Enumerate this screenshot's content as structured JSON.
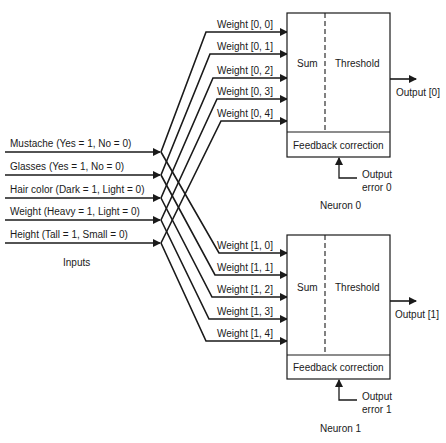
{
  "diagram": {
    "inputs_label": "Inputs",
    "inputs": [
      {
        "label": "Mustache (Yes = 1, No = 0)",
        "y": 152
      },
      {
        "label": "Glasses (Yes = 1, No = 0)",
        "y": 175
      },
      {
        "label": "Hair color (Dark = 1, Light = 0)",
        "y": 198
      },
      {
        "label": "Weight (Heavy = 1, Light = 0)",
        "y": 220
      },
      {
        "label": "Height (Tall = 1, Small = 0)",
        "y": 243
      }
    ],
    "neurons": [
      {
        "name": "Neuron 0",
        "sum_label": "Sum",
        "threshold_label": "Threshold",
        "feedback_label": "Feedback correction",
        "output_label": "Output [0]",
        "error_label_line1": "Output",
        "error_label_line2": "error 0",
        "weights": [
          {
            "label": "Weight [0, 0]",
            "y": 32,
            "corner_x": 206
          },
          {
            "label": "Weight [0, 1]",
            "y": 54,
            "corner_x": 210
          },
          {
            "label": "Weight [0, 2]",
            "y": 78,
            "corner_x": 213
          },
          {
            "label": "Weight [0, 3]",
            "y": 99,
            "corner_x": 217
          },
          {
            "label": "Weight [0, 4]",
            "y": 121,
            "corner_x": 221
          }
        ]
      },
      {
        "name": "Neuron 1",
        "sum_label": "Sum",
        "threshold_label": "Threshold",
        "feedback_label": "Feedback correction",
        "output_label": "Output [1]",
        "error_label_line1": "Output",
        "error_label_line2": "error 1",
        "weights": [
          {
            "label": "Weight [1, 0]",
            "y": 253,
            "corner_x": 219
          },
          {
            "label": "Weight [1, 1]",
            "y": 275,
            "corner_x": 215
          },
          {
            "label": "Weight [1, 2]",
            "y": 297,
            "corner_x": 212
          },
          {
            "label": "Weight [1, 3]",
            "y": 319,
            "corner_x": 209
          },
          {
            "label": "Weight [1, 4]",
            "y": 341,
            "corner_x": 206
          }
        ]
      }
    ]
  }
}
